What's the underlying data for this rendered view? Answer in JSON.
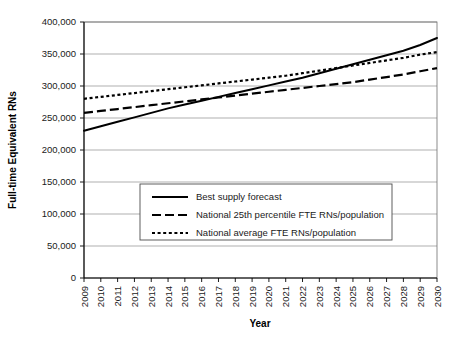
{
  "chart_data": {
    "type": "line",
    "title": "",
    "xlabel": "Year",
    "ylabel": "Full-time Equivalent RNs",
    "ylim": [
      0,
      400000
    ],
    "ytick_values": [
      0,
      50000,
      100000,
      150000,
      200000,
      250000,
      300000,
      350000,
      400000
    ],
    "ytick_labels": [
      "0",
      "50,000",
      "100,000",
      "150,000",
      "200,000",
      "250,000",
      "300,000",
      "350,000",
      "400,000"
    ],
    "grid": true,
    "grid_axis": "y",
    "legend_position": "center-left-inside",
    "categories": [
      2009,
      2010,
      2011,
      2012,
      2013,
      2014,
      2015,
      2016,
      2017,
      2018,
      2019,
      2020,
      2021,
      2022,
      2023,
      2024,
      2025,
      2026,
      2027,
      2028,
      2029,
      2030
    ],
    "xtick_labels": [
      "2009",
      "2010",
      "2011",
      "2012",
      "2013",
      "2014",
      "2015",
      "2016",
      "2017",
      "2018",
      "2019",
      "2020",
      "2021",
      "2022",
      "2023",
      "2024",
      "2025",
      "2026",
      "2027",
      "2028",
      "2029",
      "2030"
    ],
    "series": [
      {
        "name": "Best supply forecast",
        "style": "solid",
        "values": [
          230000,
          237000,
          244000,
          251000,
          258000,
          265000,
          271000,
          277000,
          283000,
          289000,
          295000,
          301000,
          307000,
          313000,
          320000,
          327000,
          334000,
          341000,
          348000,
          355000,
          364000,
          375000
        ]
      },
      {
        "name": "National 25th percentile FTE RNs/population",
        "style": "dashed",
        "values": [
          258000,
          261000,
          264000,
          267000,
          270000,
          273000,
          276000,
          279000,
          282000,
          285000,
          288000,
          291000,
          294000,
          297000,
          300000,
          303000,
          306000,
          310000,
          314000,
          318000,
          323000,
          328000
        ]
      },
      {
        "name": "National average FTE RNs/population",
        "style": "dotted",
        "values": [
          280000,
          283000,
          286000,
          289000,
          292000,
          295000,
          298000,
          301000,
          304000,
          307000,
          310000,
          313000,
          316000,
          320000,
          324000,
          328000,
          332000,
          336000,
          340000,
          344000,
          349000,
          353000
        ]
      }
    ],
    "annotations": []
  },
  "legend": {
    "items": [
      {
        "label": "Best supply forecast"
      },
      {
        "label": "National 25th percentile FTE RNs/population"
      },
      {
        "label": "National average FTE RNs/population"
      }
    ]
  }
}
